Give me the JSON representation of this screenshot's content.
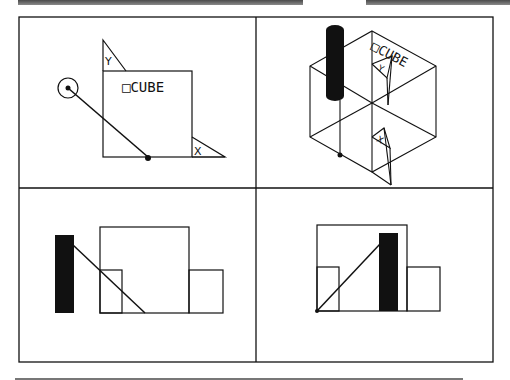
{
  "header": {
    "fragment_label": ""
  },
  "views": {
    "top_left": {
      "name": "plan-view",
      "cube_label": "□CUBE",
      "y_axis_label": "Y",
      "x_axis_label": "X"
    },
    "top_right": {
      "name": "isometric-view",
      "cube_label": "□CUBE",
      "y_axis_label": "Y",
      "x_axis_label": "X"
    },
    "bottom_left": {
      "name": "front-elevation"
    },
    "bottom_right": {
      "name": "side-elevation"
    }
  },
  "colors": {
    "line": "#111111",
    "fill": "#111111",
    "background": "#ffffff",
    "bar": "#6a6a6a"
  }
}
